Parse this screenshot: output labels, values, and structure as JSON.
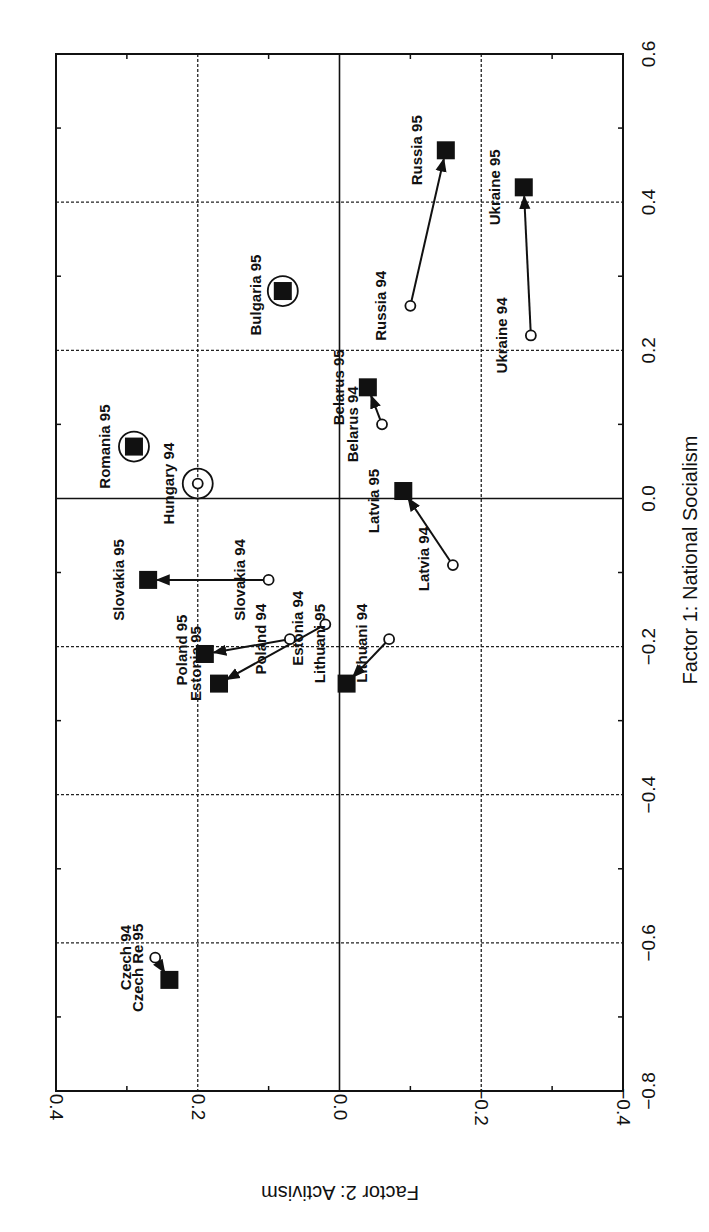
{
  "chart_data": {
    "type": "scatter",
    "orientation": "rotated 90 degrees clockwise (page scan)",
    "xlabel": "Factor 1: National Socialism",
    "ylabel": "Factor 2: Activism",
    "xlim": [
      -0.8,
      0.6
    ],
    "ylim": [
      -0.4,
      0.4
    ],
    "xticks": [
      "-0.8",
      "-0.6",
      "-0.4",
      "-0.2",
      "0.0",
      "0.2",
      "0.4",
      "0.6"
    ],
    "yticks": [
      "-0.4",
      "-0.2",
      "0.0",
      "0.2",
      "0.4"
    ],
    "grid": true,
    "legend": null,
    "marker_legend": {
      "1994": "open circle",
      "1995": "filled square",
      "highlight": "large open circle"
    },
    "points": [
      {
        "id": "russia94",
        "label": "Russia 94",
        "year": 94,
        "x": 0.26,
        "y": -0.1,
        "lx": -24,
        "ly": 0
      },
      {
        "id": "russia95",
        "label": "Russia 95",
        "year": 95,
        "x": 0.47,
        "y": -0.15,
        "lx": -24,
        "ly": 0
      },
      {
        "id": "ukraine94",
        "label": "Ukraine 94",
        "year": 94,
        "x": 0.22,
        "y": -0.27,
        "lx": -24,
        "ly": 0
      },
      {
        "id": "ukraine95",
        "label": "Ukraine 95",
        "year": 95,
        "x": 0.42,
        "y": -0.26,
        "lx": -24,
        "ly": 0
      },
      {
        "id": "bulgaria95",
        "label": "Bulgaria 95",
        "year": 95,
        "x": 0.28,
        "y": 0.08,
        "lx": -22,
        "ly": 4,
        "highlight": true
      },
      {
        "id": "belarus94",
        "label": "Belarus 94",
        "year": 94,
        "x": 0.1,
        "y": -0.06,
        "lx": -24,
        "ly": 0
      },
      {
        "id": "belarus95",
        "label": "Belarus 95",
        "year": 95,
        "x": 0.15,
        "y": -0.04,
        "lx": -24,
        "ly": 0
      },
      {
        "id": "latvia94",
        "label": "Latvia 94",
        "year": 94,
        "x": -0.09,
        "y": -0.16,
        "lx": -24,
        "ly": -6
      },
      {
        "id": "latvia95",
        "label": "Latvia 95",
        "year": 95,
        "x": 0.01,
        "y": -0.09,
        "lx": -24,
        "ly": 10
      },
      {
        "id": "romania95",
        "label": "Romania 95",
        "year": 95,
        "x": 0.07,
        "y": 0.29,
        "lx": -24,
        "ly": 0,
        "highlight": true
      },
      {
        "id": "hungary94",
        "label": "Hungary 94",
        "year": 94,
        "x": 0.02,
        "y": 0.2,
        "lx": -24,
        "ly": 0,
        "highlight": true
      },
      {
        "id": "slovakia94",
        "label": "Slovakia 94",
        "year": 94,
        "x": -0.11,
        "y": 0.1,
        "lx": -24,
        "ly": 0
      },
      {
        "id": "slovakia95",
        "label": "Slovakia 95",
        "year": 95,
        "x": -0.11,
        "y": 0.27,
        "lx": -24,
        "ly": 0
      },
      {
        "id": "poland94",
        "label": "Poland 94",
        "year": 94,
        "x": -0.19,
        "y": 0.07,
        "lx": -24,
        "ly": 0
      },
      {
        "id": "poland95",
        "label": "Poland 95",
        "year": 95,
        "x": -0.21,
        "y": 0.19,
        "lx": -18,
        "ly": -4
      },
      {
        "id": "estonia94",
        "label": "Estonia 94",
        "year": 94,
        "x": -0.17,
        "y": 0.02,
        "lx": -22,
        "ly": 4
      },
      {
        "id": "estonia95",
        "label": "Estonia 95",
        "year": 95,
        "x": -0.25,
        "y": 0.17,
        "lx": -18,
        "ly": -20
      },
      {
        "id": "lithuania94",
        "label": "Lithuani 94",
        "year": 94,
        "x": -0.19,
        "y": -0.07,
        "lx": -22,
        "ly": 4
      },
      {
        "id": "lithuania95",
        "label": "Lithuani 95",
        "year": 95,
        "x": -0.25,
        "y": -0.01,
        "lx": -22,
        "ly": -40
      },
      {
        "id": "czech94",
        "label": "Czech 94",
        "year": 94,
        "x": -0.62,
        "y": 0.26,
        "lx": -24,
        "ly": 0
      },
      {
        "id": "czech95",
        "label": "Czech Re 95",
        "year": 95,
        "x": -0.65,
        "y": 0.24,
        "lx": -26,
        "ly": -12
      }
    ],
    "arrows": [
      {
        "from": "russia94",
        "to": "russia95"
      },
      {
        "from": "ukraine94",
        "to": "ukraine95"
      },
      {
        "from": "belarus94",
        "to": "belarus95"
      },
      {
        "from": "latvia94",
        "to": "latvia95"
      },
      {
        "from": "slovakia94",
        "to": "slovakia95"
      },
      {
        "from": "poland94",
        "to": "poland95"
      },
      {
        "from": "estonia94",
        "to": "estonia95"
      },
      {
        "from": "lithuania94",
        "to": "lithuania95"
      },
      {
        "from": "czech94",
        "to": "czech95"
      }
    ],
    "colors": {
      "ink": "#111111",
      "background": "#ffffff"
    }
  }
}
